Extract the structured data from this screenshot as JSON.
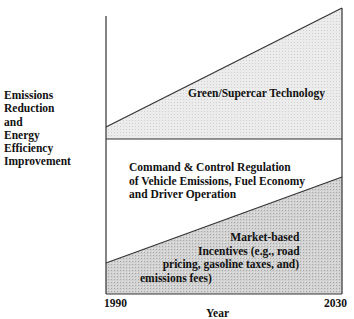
{
  "diagram": {
    "y_axis_label_lines": [
      "Emissions",
      "Reduction",
      "and",
      "Energy",
      "Efficiency",
      "Improvement"
    ],
    "x_axis_label": "Year",
    "x_ticks": [
      "1990",
      "2030"
    ],
    "regions": [
      {
        "id": "green",
        "label": "Green/Supercar Technology",
        "fill": "#e6e6e6",
        "shape": "wedge increasing"
      },
      {
        "id": "command",
        "label_lines": [
          "Command & Control Regulation",
          "of Vehicle Emissions, Fuel Economy",
          "and Driver Operation"
        ],
        "fill": "#ffffff"
      },
      {
        "id": "market",
        "label_lines": [
          "Market-based",
          "Incentives (e.g., road",
          "pricing, gasoline taxes, and)",
          "emissions fees)"
        ],
        "fill": "#cfcfcf",
        "shape": "wedge increasing"
      }
    ],
    "colors": {
      "line": "#333333",
      "light_fill": "#e8e8e8",
      "dark_fill": "#cccccc"
    }
  }
}
